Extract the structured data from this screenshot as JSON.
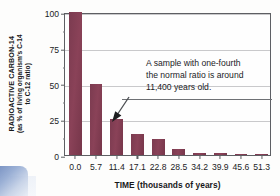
{
  "chart_data": {
    "type": "bar",
    "title": "",
    "xlabel": "TIME (thousands of years)",
    "ylabel_line1": "RADIOACTIVE CARBON-14",
    "ylabel_line2": "(as % of living organism's C-14",
    "ylabel_line3": "to C-12 ratio)",
    "categories": [
      "0.0",
      "5.7",
      "11.4",
      "17.1",
      "22.8",
      "28.5",
      "34.2",
      "39.9",
      "45.6",
      "51.3"
    ],
    "values": [
      100,
      50,
      25,
      15,
      11,
      4,
      1.5,
      1.2,
      0.8,
      0.5
    ],
    "xlim": [
      0,
      51.3
    ],
    "ylim": [
      0,
      100
    ],
    "ytick_labels": [
      "100",
      "75",
      "50",
      "25",
      "0"
    ],
    "ytick_values": [
      100,
      75,
      50,
      25,
      0
    ],
    "grid": "horizontal",
    "legend": "none",
    "bar_color": "#7d3a4e",
    "annotations": [
      {
        "text_line1": "A sample with one-fourth",
        "text_line2": "the normal ratio is around",
        "text_line3": "11,400 years old.",
        "points_to_category": "11.4",
        "points_to_value": 25
      }
    ]
  },
  "axis": {
    "y_title_main": "RADIOACTIVE CARBON-14",
    "y_title_sub_a": "(as % of living organism's C-14",
    "y_title_sub_b": "to C-12 ratio)",
    "x_title": "TIME (thousands of years)"
  },
  "annotation": {
    "line1": "A sample with one-fourth",
    "line2": "the normal ratio is around",
    "line3": "11,400 years old."
  }
}
